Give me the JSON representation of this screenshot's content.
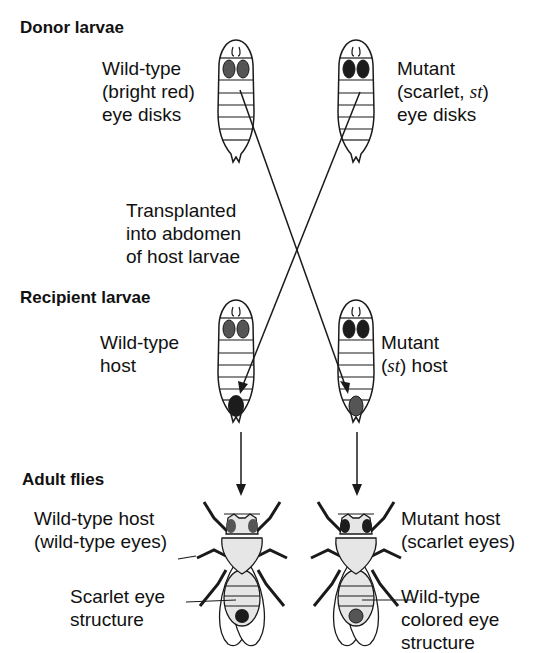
{
  "sections": {
    "donor": "Donor larvae",
    "recipient": "Recipient larvae",
    "adult": "Adult flies"
  },
  "labels": {
    "donor_wt": [
      "Wild-type",
      "(bright red)",
      "eye disks"
    ],
    "donor_mut_line1": "Mutant",
    "donor_mut_line2_pre": "(scarlet, ",
    "donor_mut_line2_it": "st",
    "donor_mut_line2_post": ")",
    "donor_mut_line3": "eye disks",
    "transplant": [
      "Transplanted",
      "into abdomen",
      "of host larvae"
    ],
    "recipient_wt": [
      "Wild-type",
      "host"
    ],
    "recipient_mut_line1": "Mutant",
    "recipient_mut_line2_pre": "(",
    "recipient_mut_line2_it": "st",
    "recipient_mut_line2_post": ") host",
    "adult_wt": [
      "Wild-type host",
      "(wild-type eyes)"
    ],
    "adult_wt_structure": [
      "Scarlet eye",
      "structure"
    ],
    "adult_mut": [
      "Mutant host",
      "(scarlet eyes)"
    ],
    "adult_mut_structure": [
      "Wild-type",
      "colored eye",
      "structure"
    ]
  },
  "colors": {
    "line": "#1a1a1a",
    "wt_eye": "#555555",
    "mut_eye": "#1c1c1c",
    "fly_body": "#e6e6e6"
  }
}
